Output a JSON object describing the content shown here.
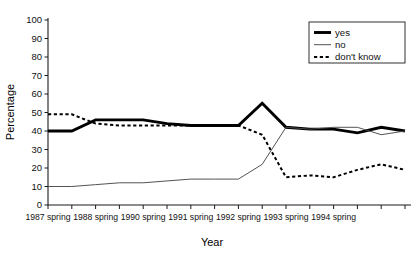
{
  "chart_data": {
    "type": "line",
    "title": "",
    "xlabel": "Year",
    "ylabel": "Percentage",
    "ylim": [
      0,
      100
    ],
    "ytick_step": 10,
    "yticks": [
      0,
      10,
      20,
      30,
      40,
      50,
      60,
      70,
      80,
      90,
      100
    ],
    "grid": false,
    "legend_position": "top-right",
    "x": [
      "1987 spring",
      "1987 autumn",
      "1988 spring",
      "1988 autumn",
      "1990 spring",
      "1990 autumn",
      "1991 spring",
      "1991 autumn",
      "1992 spring",
      "1992 autumn",
      "1993 spring",
      "1993 autumn",
      "1994 spring",
      "1994 autumn",
      "1995 spring",
      "1995 autumn"
    ],
    "xtick_labels": [
      "1987 spring",
      "1988 spring",
      "1990 spring",
      "1991 spring",
      "1992 spring",
      "1993 spring",
      "1994 spring"
    ],
    "xtick_label_indices": [
      0,
      2,
      4,
      6,
      8,
      10,
      12
    ],
    "series": [
      {
        "name": "yes",
        "style": "thick-solid",
        "values": [
          40,
          40,
          46,
          46,
          46,
          44,
          43,
          43,
          43,
          55,
          42,
          41,
          41,
          39,
          42,
          40
        ]
      },
      {
        "name": "no",
        "style": "thin-solid",
        "values": [
          10,
          10,
          11,
          12,
          12,
          13,
          14,
          14,
          14,
          22,
          42,
          41,
          42,
          42,
          38,
          40
        ]
      },
      {
        "name": "don't know",
        "style": "dashed",
        "values": [
          49,
          49,
          44,
          43,
          43,
          43,
          43,
          43,
          43,
          38,
          15,
          16,
          15,
          19,
          22,
          19
        ]
      }
    ]
  },
  "legend": {
    "entries": [
      {
        "label": "yes"
      },
      {
        "label": "no"
      },
      {
        "label": "don't know"
      }
    ]
  },
  "axes": {
    "y_title": "Percentage",
    "x_title": "Year"
  }
}
